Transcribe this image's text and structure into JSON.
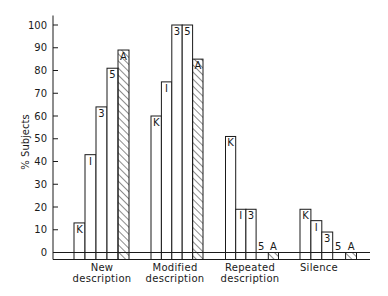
{
  "chart_data": {
    "type": "bar",
    "title": "",
    "xlabel": "",
    "ylabel": "% Subjects",
    "ylim": [
      0,
      100
    ],
    "yticks": [
      0,
      10,
      20,
      30,
      40,
      50,
      60,
      70,
      80,
      90,
      100
    ],
    "grid": false,
    "legend": "none (bars labeled inline with series letter)",
    "categories": [
      {
        "line1": "New",
        "line2": "description"
      },
      {
        "line1": "Modified",
        "line2": "description"
      },
      {
        "line1": "Repeated",
        "line2": "description"
      },
      {
        "line1": "Silence",
        "line2": ""
      }
    ],
    "series": [
      {
        "name": "K",
        "hatched": false,
        "values": [
          13,
          60,
          51,
          19
        ]
      },
      {
        "name": "I",
        "hatched": false,
        "values": [
          43,
          75,
          19,
          14
        ]
      },
      {
        "name": "3",
        "hatched": false,
        "values": [
          64,
          100,
          19,
          9
        ]
      },
      {
        "name": "5",
        "hatched": false,
        "values": [
          81,
          100,
          0,
          0
        ]
      },
      {
        "name": "A",
        "hatched": true,
        "values": [
          89,
          85,
          0,
          0
        ]
      }
    ]
  },
  "colors": {
    "ink": "#1a1a1a",
    "background": "#ffffff"
  }
}
